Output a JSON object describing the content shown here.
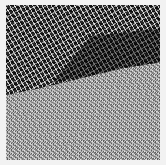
{
  "image": {
    "description": "Grayscale noisy texture photograph: dark tree foliage in the upper portion, light grass field in the lower portion, separated by a diagonal boundary descending from right to left.",
    "regions": [
      {
        "name": "foliage",
        "tone": "dark",
        "colors": [
          "#000000",
          "#ffffff"
        ]
      },
      {
        "name": "grass",
        "tone": "light-gray",
        "colors": [
          "#a9a9a9",
          "#ffffff"
        ]
      }
    ],
    "border_color": "#f2f2f2"
  }
}
